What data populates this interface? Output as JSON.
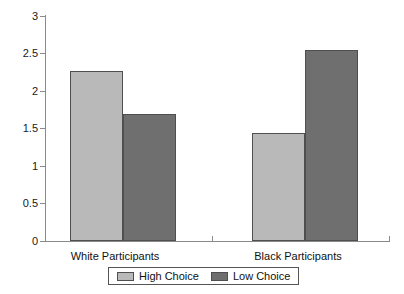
{
  "chart_data": {
    "type": "bar",
    "title": "",
    "xlabel": "",
    "ylabel": "",
    "categories": [
      "White Participants",
      "Black Participants"
    ],
    "series": [
      {
        "name": "High Choice",
        "color": "#b9b9b9",
        "values": [
          2.27,
          1.44
        ]
      },
      {
        "name": "Low Choice",
        "color": "#6f6f6f",
        "values": [
          1.7,
          2.55
        ]
      }
    ],
    "ylim": [
      0,
      3
    ],
    "yticks": [
      "0",
      "0.5",
      "1",
      "1.5",
      "2",
      "2.5",
      "3"
    ],
    "ytick_values": [
      0,
      0.5,
      1,
      1.5,
      2,
      2.5,
      3
    ],
    "grid": false,
    "legend_position": "bottom"
  },
  "axis": {
    "y_labels": [
      "3",
      "2.5",
      "2",
      "1.5",
      "1",
      "0.5",
      "0"
    ]
  },
  "legend": {
    "items": [
      {
        "label": "High Choice",
        "swatch": "light"
      },
      {
        "label": "Low Choice",
        "swatch": "dark"
      }
    ]
  }
}
